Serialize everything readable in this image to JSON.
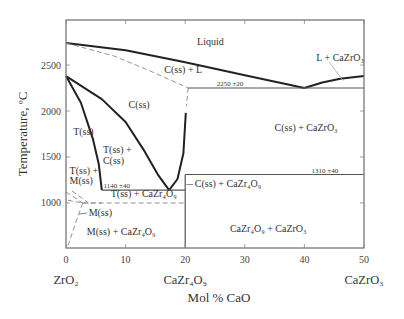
{
  "chart_data": {
    "type": "phase-diagram",
    "title": "",
    "xlabel": "Mol % CaO",
    "ylabel": "Temperature, ºC",
    "xlim": [
      0,
      50
    ],
    "ylim": [
      510,
      2990
    ],
    "x_ticks": [
      0,
      10,
      20,
      30,
      40,
      50
    ],
    "y_ticks": [
      1000,
      1500,
      2000,
      2500
    ],
    "x_tick_labels": [
      "0",
      "10",
      "20",
      "30",
      "40",
      "50"
    ],
    "y_tick_labels": [
      "1000",
      "1500",
      "2000",
      "2500"
    ],
    "compositions": [
      {
        "x": 0,
        "label": "ZrO₂"
      },
      {
        "x": 20,
        "label": "CaZr₄O₉"
      },
      {
        "x": 50,
        "label": "CaZrO₃"
      }
    ],
    "regions": [
      {
        "label": "Liquid",
        "x": 22,
        "y": 2720
      },
      {
        "label": "L + CaZrO₃",
        "x": 42,
        "y": 2540
      },
      {
        "label": "C(ss) + L",
        "x": 16.5,
        "y": 2410
      },
      {
        "label": "C(ss)",
        "x": 10.5,
        "y": 2030
      },
      {
        "label": "C(ss) + CaZrO₃",
        "x": 35,
        "y": 1780
      },
      {
        "label": "T(ss)",
        "x": 1.2,
        "y": 1740
      },
      {
        "label": "T(ss) +",
        "x": 6.2,
        "y": 1540
      },
      {
        "label": "C(ss)",
        "x": 6.2,
        "y": 1420
      },
      {
        "label": "T(ss) +",
        "x": 0.6,
        "y": 1320
      },
      {
        "label": "M(ss)",
        "x": 0.6,
        "y": 1210
      },
      {
        "label": "C(ss) + CaZr₄O₉",
        "x": 21.6,
        "y": 1170
      },
      {
        "label": "T(ss) + CaZr₄O₉",
        "x": 7.5,
        "y": 1060
      },
      {
        "label": "M(ss)",
        "x": 3.8,
        "y": 860
      },
      {
        "label": "M(ss) + CaZr₄O₉",
        "x": 3.5,
        "y": 650
      },
      {
        "label": "CaZr₄O₉ + CaZrO₃",
        "x": 27.5,
        "y": 680
      }
    ],
    "annotations": [
      {
        "text": "2250 ±20",
        "x": 25.3,
        "y": 2270
      },
      {
        "text": "1310 ±40",
        "x": 41.2,
        "y": 1330
      },
      {
        "text": "1140 ±40",
        "x": 6.3,
        "y": 1160
      }
    ],
    "invariants": [
      {
        "name": "eutectic C(ss)-CaZrO3",
        "T": 2250,
        "x": 40
      },
      {
        "name": "eutectoid C(ss)-CaZr4O9",
        "T": 1140,
        "x": 17.3
      },
      {
        "name": "CaZr4O9 decomposition",
        "T": 1310,
        "x": 20
      }
    ],
    "series": [
      {
        "name": "liquidus-left",
        "style": "solid",
        "points": [
          [
            0,
            2740
          ],
          [
            10,
            2660
          ],
          [
            20,
            2530
          ],
          [
            30,
            2390
          ],
          [
            40,
            2250
          ]
        ]
      },
      {
        "name": "liquidus-right",
        "style": "solid",
        "points": [
          [
            40,
            2250
          ],
          [
            43,
            2310
          ],
          [
            46,
            2350
          ],
          [
            50,
            2380
          ]
        ]
      },
      {
        "name": "solidus-C",
        "style": "dashed",
        "points": [
          [
            0,
            2740
          ],
          [
            8,
            2600
          ],
          [
            14,
            2440
          ],
          [
            20.5,
            2250
          ]
        ]
      },
      {
        "name": "C-boundary-dashed",
        "style": "dashed",
        "points": [
          [
            20.5,
            2250
          ],
          [
            20.2,
            2050
          ]
        ]
      },
      {
        "name": "eutectic-line",
        "style": "solid",
        "points": [
          [
            20.5,
            2250
          ],
          [
            50,
            2250
          ]
        ]
      },
      {
        "name": "T-C boundary upper",
        "style": "solid",
        "points": [
          [
            0,
            2380
          ],
          [
            6,
            2130
          ],
          [
            10,
            1880
          ],
          [
            13,
            1580
          ],
          [
            15.5,
            1300
          ],
          [
            17.3,
            1140
          ]
        ]
      },
      {
        "name": "T boundary",
        "style": "solid",
        "points": [
          [
            0,
            2380
          ],
          [
            2.5,
            2090
          ],
          [
            4.5,
            1700
          ],
          [
            5.5,
            1420
          ],
          [
            6,
            1140
          ]
        ]
      },
      {
        "name": "C right boundary",
        "style": "solid",
        "points": [
          [
            17.3,
            1140
          ],
          [
            18.7,
            1260
          ],
          [
            19.7,
            1540
          ],
          [
            20.1,
            1980
          ]
        ]
      },
      {
        "name": "1310 line",
        "style": "solid",
        "points": [
          [
            20,
            1310
          ],
          [
            50,
            1310
          ]
        ]
      },
      {
        "name": "1140 line",
        "style": "solid",
        "points": [
          [
            6,
            1140
          ],
          [
            20,
            1140
          ]
        ]
      },
      {
        "name": "CaZr4O9 vertical",
        "style": "solid",
        "points": [
          [
            20,
            510
          ],
          [
            20,
            1310
          ]
        ]
      },
      {
        "name": "monoclinic line",
        "style": "dashed",
        "points": [
          [
            2.8,
            1000
          ],
          [
            20,
            1000
          ]
        ]
      },
      {
        "name": "M-T dashed a",
        "style": "dashed",
        "points": [
          [
            0,
            1120
          ],
          [
            2.8,
            1000
          ]
        ]
      },
      {
        "name": "M-T dashed b",
        "style": "dashed",
        "points": [
          [
            0.3,
            1030
          ],
          [
            2.8,
            1000
          ]
        ]
      },
      {
        "name": "M-T dashed c",
        "style": "dashed",
        "points": [
          [
            2.8,
            1000
          ],
          [
            6,
            1000
          ]
        ]
      },
      {
        "name": "M boundary",
        "style": "dashed",
        "points": [
          [
            2.8,
            1000
          ],
          [
            1.5,
            760
          ],
          [
            0.3,
            530
          ]
        ]
      },
      {
        "name": "T+M dashed",
        "style": "dashed",
        "points": [
          [
            1.0,
            1130
          ],
          [
            3.8,
            1000
          ]
        ]
      },
      {
        "name": "L + CaZrO3 leader",
        "style": "thin",
        "points": [
          [
            44.2,
            2530
          ],
          [
            46.5,
            2330
          ]
        ]
      }
    ]
  }
}
